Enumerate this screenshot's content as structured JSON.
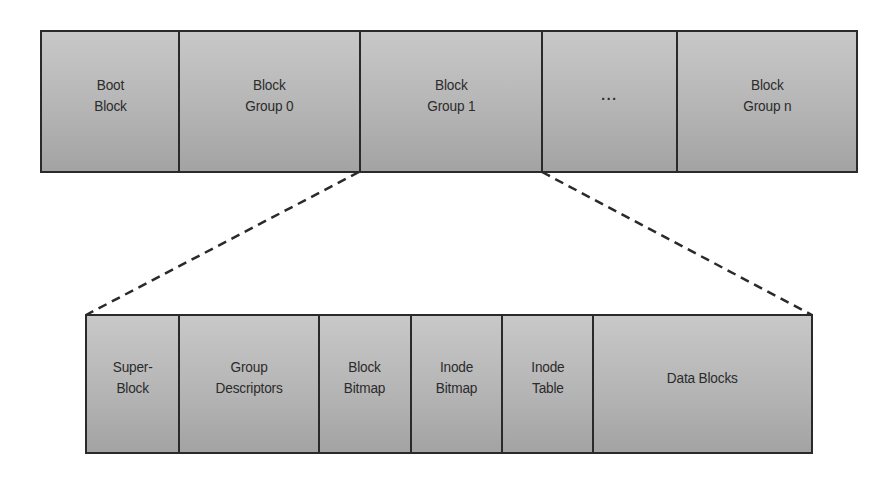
{
  "diagram": {
    "type": "ext2 filesystem layout",
    "top_row": {
      "cells": [
        {
          "label": "Boot\nBlock",
          "width": 138
        },
        {
          "label": "Block\nGroup 0",
          "width": 181
        },
        {
          "label": "Block\nGroup 1",
          "width": 182
        },
        {
          "label": "...",
          "width": 135
        },
        {
          "label": "Block\nGroup n",
          "width": 178
        }
      ]
    },
    "bottom_row": {
      "cells": [
        {
          "label": "Super-\nBlock",
          "width": 93
        },
        {
          "label": "Group\nDescriptors",
          "width": 140
        },
        {
          "label": "Block\nBitmap",
          "width": 92
        },
        {
          "label": "Inode\nBitmap",
          "width": 91
        },
        {
          "label": "Inode\nTable",
          "width": 91
        },
        {
          "label": "Data Blocks",
          "width": 217
        }
      ]
    },
    "expansion": {
      "from": "Block\nGroup 1",
      "style": "dashed",
      "color": "#2a2a2a"
    },
    "colors": {
      "border": "#2a2a2a",
      "fill_top": "#c8c8c8",
      "fill_bottom": "#a3a3a3",
      "text": "#2b2b2b"
    }
  }
}
